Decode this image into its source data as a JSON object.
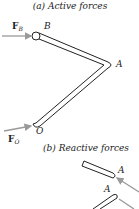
{
  "diagram": {
    "caption_a": "(a) Active forces",
    "caption_b": "(b) Reactive forces",
    "points": {
      "B": "B",
      "A": "A",
      "O": "O"
    },
    "forces": {
      "FB": {
        "main": "F",
        "sub": "B"
      },
      "FO": {
        "main": "F",
        "sub": "O"
      }
    },
    "reactive_labels": {
      "A_upper": "A",
      "A_lower": "A"
    },
    "colors": {
      "member_stroke": "#222222",
      "arrow": "#9a9a9a",
      "text": "#222222"
    }
  }
}
